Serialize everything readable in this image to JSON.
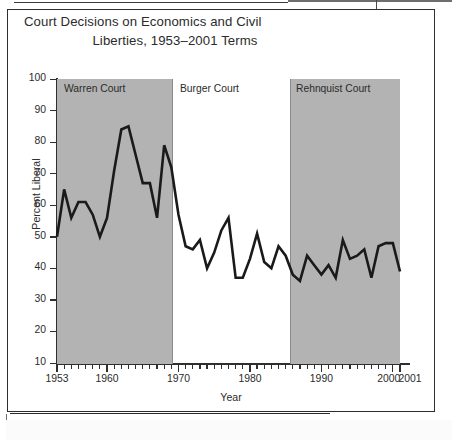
{
  "figure": {
    "title_line1": "Court Decisions on Economics and Civil",
    "title_line2": "Liberties, 1953–2001 Terms"
  },
  "axes": {
    "y_title": "Percent Liberal",
    "x_title": "Year",
    "y_ticks": [
      "100",
      "90",
      "80",
      "70",
      "60",
      "50",
      "40",
      "30",
      "20",
      "10"
    ],
    "x_ticks": [
      "1953",
      "1960",
      "1970",
      "1980",
      "1990",
      "2000",
      "2001"
    ]
  },
  "eras": [
    {
      "name": "warren",
      "label": "Warren Court",
      "shaded": true
    },
    {
      "name": "burger",
      "label": "Burger Court",
      "shaded": false
    },
    {
      "name": "rehnquist",
      "label": "Rehnquist Court",
      "shaded": true
    }
  ],
  "colors": {
    "band_shade": "#b3b3b3",
    "line": "#1a1a1a",
    "axis": "#2e2e2e",
    "text": "#2b2b2b",
    "background": "#ffffff"
  },
  "chart_data": {
    "type": "line",
    "title": "Court Decisions on Economics and Civil Liberties, 1953–2001 Terms",
    "xlabel": "Year",
    "ylabel": "Percent Liberal",
    "xlim": [
      1953,
      2001
    ],
    "ylim": [
      10,
      100
    ],
    "ytick_step": 10,
    "grid": false,
    "legend": false,
    "annotations": [
      {
        "text": "Warren Court",
        "x_range": [
          1953,
          1968
        ],
        "shaded": true
      },
      {
        "text": "Burger Court",
        "x_range": [
          1969,
          1985
        ],
        "shaded": false
      },
      {
        "text": "Rehnquist Court",
        "x_range": [
          1986,
          2001
        ],
        "shaded": true
      }
    ],
    "series": [
      {
        "name": "Percent Liberal",
        "x": [
          1953,
          1954,
          1955,
          1956,
          1957,
          1958,
          1959,
          1960,
          1961,
          1962,
          1963,
          1964,
          1965,
          1966,
          1967,
          1968,
          1969,
          1970,
          1971,
          1972,
          1973,
          1974,
          1975,
          1976,
          1977,
          1978,
          1979,
          1980,
          1981,
          1982,
          1983,
          1984,
          1985,
          1986,
          1987,
          1988,
          1989,
          1990,
          1991,
          1992,
          1993,
          1994,
          1995,
          1996,
          1997,
          1998,
          1999,
          2000,
          2001
        ],
        "values": [
          50,
          65,
          56,
          61,
          61,
          57,
          50,
          56,
          71,
          84,
          85,
          76,
          67,
          67,
          56,
          79,
          72,
          57,
          47,
          46,
          49,
          40,
          45,
          52,
          56,
          37,
          37,
          43,
          51,
          42,
          40,
          47,
          44,
          38,
          36,
          44,
          41,
          38,
          41,
          37,
          49,
          43,
          44,
          46,
          37,
          47,
          48,
          48,
          39
        ]
      }
    ]
  }
}
